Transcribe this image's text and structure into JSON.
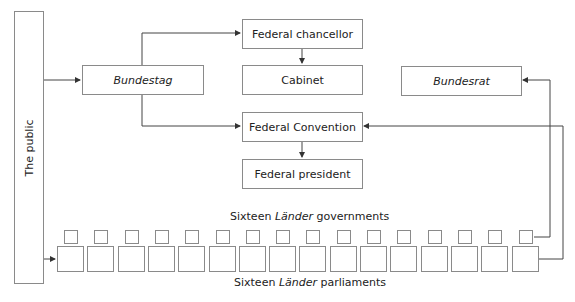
{
  "diagram": {
    "public": {
      "label": "The public"
    },
    "bundestag": {
      "label": "Bundestag"
    },
    "chancellor": {
      "label": "Federal chancellor"
    },
    "cabinet": {
      "label": "Cabinet"
    },
    "convention": {
      "label": "Federal Convention"
    },
    "president": {
      "label": "Federal president"
    },
    "bundesrat": {
      "label": "Bundesrat"
    },
    "governments": {
      "prefix": "Sixteen ",
      "italic": "Länder",
      "suffix": " governments",
      "count": 16
    },
    "parliaments": {
      "prefix": "Sixteen ",
      "italic": "Länder",
      "suffix": " parliaments",
      "count": 16
    },
    "edges": [
      {
        "from": "public",
        "to": "bundestag"
      },
      {
        "from": "bundestag",
        "to": "chancellor"
      },
      {
        "from": "bundestag",
        "to": "convention"
      },
      {
        "from": "chancellor",
        "to": "cabinet"
      },
      {
        "from": "convention",
        "to": "president"
      },
      {
        "from": "governments",
        "to": "bundesrat"
      },
      {
        "from": "parliaments",
        "to": "convention"
      },
      {
        "from": "public",
        "to": "parliaments"
      }
    ],
    "colors": {
      "line": "#444444",
      "border": "#8a8a8a"
    }
  }
}
